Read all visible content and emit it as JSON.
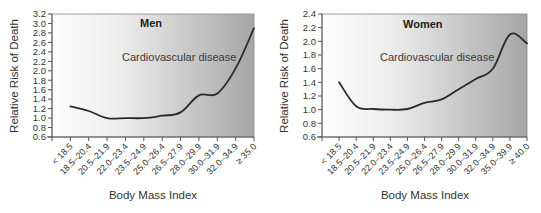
{
  "colors": {
    "gradient_start": "#fdfdfd",
    "gradient_end": "#a6a6a6",
    "curve": "#2a2a2a"
  },
  "chart_data": [
    {
      "type": "line",
      "title": "Men",
      "annotation": "Cardiovascular disease",
      "xlabel": "Body Mass Index",
      "ylabel": "Relative Risk of Death",
      "ylim": [
        0.6,
        3.2
      ],
      "yticks": [
        "0.6",
        "0.8",
        "1.0",
        "1.2",
        "1.4",
        "1.6",
        "1.8",
        "2.0",
        "2.2",
        "2.4",
        "2.6",
        "2.8",
        "3.0",
        "3.2"
      ],
      "grid": false,
      "legend": null,
      "categories": [
        "< 18.5",
        "18.5–20.4",
        "20.5–21.9",
        "22.0–23.4",
        "23.5–24.9",
        "25.0–26.4",
        "26.5–27.9",
        "28.0–29.9",
        "30.0–31.9",
        "32.0–34.9",
        "≥ 35.0"
      ],
      "series": [
        {
          "name": "Cardiovascular disease",
          "values": [
            1.25,
            1.15,
            1.0,
            1.0,
            1.0,
            1.05,
            1.12,
            1.48,
            1.52,
            2.05,
            2.9
          ]
        }
      ]
    },
    {
      "type": "line",
      "title": "Women",
      "annotation": "Cardiovascular disease",
      "xlabel": "Body Mass Index",
      "ylabel": "Relative Risk of Death",
      "ylim": [
        0.6,
        2.4
      ],
      "yticks": [
        "0.6",
        "0.8",
        "1.0",
        "1.2",
        "1.4",
        "1.6",
        "1.8",
        "2.0",
        "2.2",
        "2.4"
      ],
      "grid": false,
      "legend": null,
      "categories": [
        "< 18.5",
        "18.5–20.4",
        "20.5–21.9",
        "22.0–23.4",
        "23.5–24.9",
        "25.0–26.4",
        "26.5–27.9",
        "28.0–29.9",
        "30.0–31.9",
        "32.0–34.9",
        "35.0–39.9",
        "≥ 40.0"
      ],
      "series": [
        {
          "name": "Cardiovascular disease",
          "values": [
            1.4,
            1.05,
            1.01,
            1.0,
            1.01,
            1.1,
            1.15,
            1.3,
            1.45,
            1.6,
            2.1,
            1.97
          ]
        }
      ]
    }
  ]
}
